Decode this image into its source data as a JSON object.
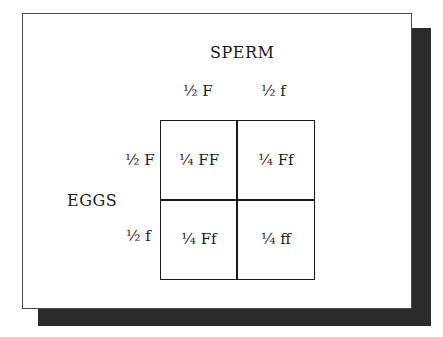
{
  "diagram": {
    "type": "punnett-square",
    "column_header": "SPERM",
    "row_header": "EGGS",
    "columns": [
      "½ F",
      "½ f"
    ],
    "rows": [
      "½ F",
      "½ f"
    ],
    "cells": [
      [
        "¼ FF",
        "¼ Ff"
      ],
      [
        "¼ Ff",
        "¼ ff"
      ]
    ]
  }
}
